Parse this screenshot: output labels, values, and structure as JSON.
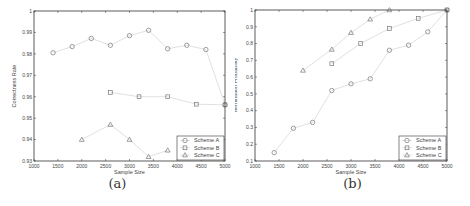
{
  "chart_data": [
    {
      "type": "line",
      "panel": "a",
      "caption": "(a)",
      "title": "",
      "xlabel": "Sample Size",
      "ylabel": "Correctness Rate",
      "xlim": [
        1000,
        5000
      ],
      "ylim": [
        0.93,
        1.0
      ],
      "xticks": [
        1000,
        1500,
        2000,
        2500,
        3000,
        3500,
        4000,
        4500,
        5000
      ],
      "xtick_labels": [
        "1000",
        "1500",
        "2000",
        "2500",
        "3000",
        "3500",
        "4000",
        "4500",
        "5000"
      ],
      "yticks": [
        0.93,
        0.94,
        0.95,
        0.96,
        0.97,
        0.98,
        0.99,
        1.0
      ],
      "ytick_labels": [
        "0.93",
        "0.94",
        "0.95",
        "0.96",
        "0.97",
        "0.98",
        "0.99",
        "1"
      ],
      "grid": false,
      "legend_position": "lower right",
      "series": [
        {
          "name": "Scheme A",
          "marker": "circle",
          "x": [
            1400,
            1800,
            2200,
            2600,
            3000,
            3400,
            3800,
            4200,
            4600,
            5000
          ],
          "values": [
            0.9805,
            0.9834,
            0.9872,
            0.984,
            0.9885,
            0.991,
            0.9824,
            0.984,
            0.982,
            0.9562
          ]
        },
        {
          "name": "Scheme B",
          "marker": "square",
          "x": [
            2600,
            3200,
            3800,
            4400,
            5000
          ],
          "values": [
            0.962,
            0.96,
            0.96,
            0.9565,
            0.9562
          ]
        },
        {
          "name": "Scheme C",
          "marker": "triangle",
          "x": [
            2000,
            2600,
            3000,
            3400,
            3800
          ],
          "values": [
            0.94,
            0.947,
            0.94,
            0.932,
            0.935
          ]
        }
      ]
    },
    {
      "type": "line",
      "panel": "b",
      "caption": "(b)",
      "title": "",
      "xlabel": "Sample Size",
      "ylabel": "Termination Probability",
      "xlim": [
        1000,
        5000
      ],
      "ylim": [
        0.1,
        1.0
      ],
      "xticks": [
        1000,
        1500,
        2000,
        2500,
        3000,
        3500,
        4000,
        4500,
        5000
      ],
      "xtick_labels": [
        "1000",
        "1500",
        "2000",
        "2500",
        "3000",
        "3500",
        "4000",
        "4500",
        "5000"
      ],
      "yticks": [
        0.1,
        0.2,
        0.3,
        0.4,
        0.5,
        0.6,
        0.7,
        0.8,
        0.9,
        1.0
      ],
      "ytick_labels": [
        "0.1",
        "0.2",
        "0.3",
        "0.4",
        "0.5",
        "0.6",
        "0.7",
        "0.8",
        "0.9",
        "1"
      ],
      "grid": false,
      "legend_position": "lower right",
      "series": [
        {
          "name": "Scheme A",
          "marker": "circle",
          "x": [
            1400,
            1800,
            2200,
            2600,
            3000,
            3400,
            3800,
            4200,
            4600,
            5000
          ],
          "values": [
            0.15,
            0.295,
            0.33,
            0.52,
            0.56,
            0.59,
            0.76,
            0.79,
            0.87,
            1.0
          ]
        },
        {
          "name": "Scheme B",
          "marker": "square",
          "x": [
            2600,
            3200,
            3800,
            4400,
            5000
          ],
          "values": [
            0.68,
            0.8,
            0.89,
            0.95,
            1.0
          ]
        },
        {
          "name": "Scheme C",
          "marker": "triangle",
          "x": [
            2000,
            2600,
            3000,
            3400,
            3800
          ],
          "values": [
            0.64,
            0.765,
            0.865,
            0.945,
            1.0
          ]
        }
      ]
    }
  ],
  "colors": {
    "axis": "#333333",
    "line": "#d8d8d8",
    "marker": "#777777",
    "text": "#444444"
  }
}
